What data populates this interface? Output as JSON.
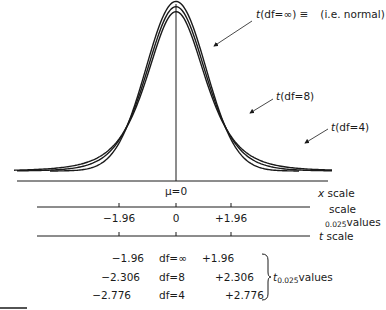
{
  "chart_data": {
    "type": "line",
    "title": "",
    "series": [
      {
        "name": "t(df=∞) ≡ (i.e. normal)",
        "df": "∞",
        "label_var": "t",
        "label_args": "(df=∞) ≡",
        "label_note": "(i.e. normal)"
      },
      {
        "name": "t(df=8)",
        "df": 8,
        "label_var": "t",
        "label_args": "(df=8)"
      },
      {
        "name": "t(df=4)",
        "df": 4,
        "label_var": "t",
        "label_args": "(df=4)"
      }
    ],
    "center_label": "μ=0",
    "axes": [
      {
        "name": "x scale",
        "label_var": "x",
        "label_rest": " scale"
      },
      {
        "name": "z scale",
        "label_top": "scale",
        "label_sub": "0.025",
        "label_rest": "values",
        "ticks": [
          {
            "value": -1.96,
            "label": "−1.96"
          },
          {
            "value": 0,
            "label": "0"
          },
          {
            "value": 1.96,
            "label": "+1.96"
          }
        ]
      },
      {
        "name": "t scale",
        "label_var": "t",
        "label_rest": " scale"
      }
    ],
    "table": {
      "rows": [
        {
          "lower": "−1.96",
          "df": "df=∞",
          "upper": "+1.96"
        },
        {
          "lower": "−2.306",
          "df": "df=8",
          "upper": "+2.306"
        },
        {
          "lower": "−2.776",
          "df": "df=4",
          "upper": "+2.776"
        }
      ],
      "group_label_var": "t",
      "group_label_sub": "0.025",
      "group_label_rest": "values"
    }
  }
}
